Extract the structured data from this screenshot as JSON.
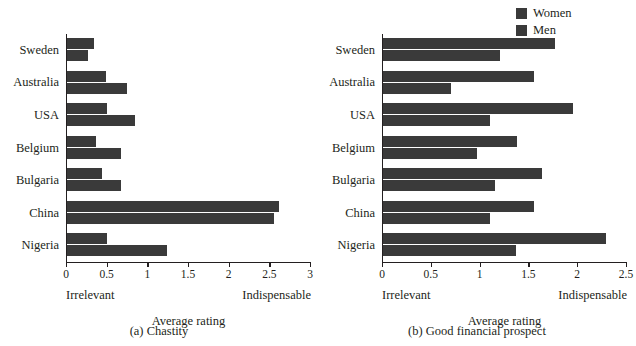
{
  "legend": {
    "position": "top-right",
    "swatch_color": "#3a3a3a",
    "entries": [
      {
        "label": "Women",
        "icon": "legend-swatch-icon"
      },
      {
        "label": "Men",
        "icon": "legend-swatch-icon"
      }
    ]
  },
  "chart_data": [
    {
      "type": "bar",
      "orientation": "horizontal",
      "panel_id": "a",
      "title": "(a) Chastity",
      "xlabel": "Average rating",
      "ylabel": "",
      "xlim": [
        0,
        3
      ],
      "xticks": [
        0,
        0.5,
        1,
        1.5,
        2,
        2.5,
        3
      ],
      "xtick_labels": [
        "0",
        "0.5",
        "1",
        "1.5",
        "2",
        "2.5",
        "3"
      ],
      "axis_low_label": "Irrelevant",
      "axis_high_label": "Indispensable",
      "grid": false,
      "categories": [
        "Sweden",
        "Australia",
        "USA",
        "Belgium",
        "Bulgaria",
        "China",
        "Nigeria"
      ],
      "series": [
        {
          "name": "Women",
          "color": "#3a3a3a",
          "values": [
            0.33,
            0.48,
            0.49,
            0.36,
            0.43,
            2.61,
            0.49
          ]
        },
        {
          "name": "Men",
          "color": "#3a3a3a",
          "values": [
            0.26,
            0.74,
            0.84,
            0.67,
            0.67,
            2.54,
            1.23
          ]
        }
      ]
    },
    {
      "type": "bar",
      "orientation": "horizontal",
      "panel_id": "b",
      "title": "(b) Good financial prospect",
      "xlabel": "Average rating",
      "ylabel": "",
      "xlim": [
        0,
        2.5
      ],
      "xticks": [
        0,
        0.5,
        1,
        1.5,
        2,
        2.5
      ],
      "xtick_labels": [
        "0",
        "0.5",
        "1",
        "1.5",
        "2",
        "2.5"
      ],
      "axis_low_label": "Irrelevant",
      "axis_high_label": "Indispensable",
      "grid": false,
      "categories": [
        "Sweden",
        "Australia",
        "USA",
        "Belgium",
        "Bulgaria",
        "China",
        "Nigeria"
      ],
      "series": [
        {
          "name": "Women",
          "color": "#3a3a3a",
          "values": [
            1.76,
            1.55,
            1.95,
            1.37,
            1.63,
            1.55,
            2.28
          ]
        },
        {
          "name": "Men",
          "color": "#3a3a3a",
          "values": [
            1.2,
            0.7,
            1.1,
            0.96,
            1.15,
            1.1,
            1.36
          ]
        }
      ]
    }
  ]
}
